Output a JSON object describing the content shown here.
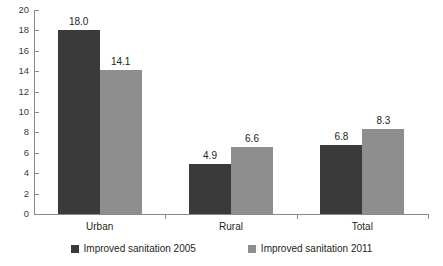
{
  "chart_data": {
    "type": "bar",
    "title": "",
    "subtitle": "",
    "xlabel": "",
    "ylabel": "",
    "categories": [
      "Urban",
      "Rural",
      "Total"
    ],
    "series": [
      {
        "name": "Improved sanitation 2005",
        "color": "#3a3a3a",
        "values": [
          18.0,
          4.9,
          6.8
        ],
        "labels": [
          "18.0",
          "4.9",
          "6.8"
        ]
      },
      {
        "name": "Improved sanitation 2011",
        "color": "#8e8e8e",
        "values": [
          14.1,
          6.6,
          8.3
        ],
        "labels": [
          "14.1",
          "6.6",
          "8.3"
        ]
      }
    ],
    "ylim": [
      0,
      20
    ],
    "yticks": [
      0,
      2,
      4,
      6,
      8,
      10,
      12,
      14,
      16,
      18,
      20
    ],
    "ytick_labels": [
      "0",
      "2",
      "4",
      "6",
      "8",
      "10",
      "12",
      "14",
      "16",
      "18",
      "20"
    ],
    "grid": false,
    "legend_position": "bottom"
  },
  "legend": {
    "items": [
      {
        "label": "Improved sanitation 2005",
        "color": "#3a3a3a"
      },
      {
        "label": "Improved sanitation 2011",
        "color": "#8e8e8e"
      }
    ]
  },
  "axis": {
    "line_color": "#8a8a8a"
  }
}
